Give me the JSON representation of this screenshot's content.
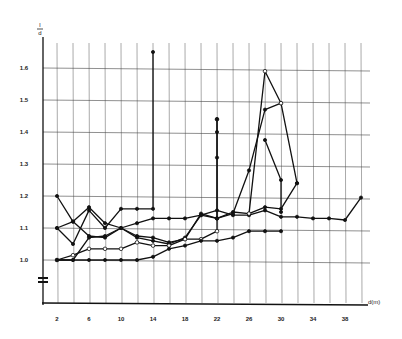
{
  "chart_data": {
    "type": "line",
    "title": "",
    "xlabel": "d(m)",
    "ylabel": "l/d",
    "xlim": [
      0,
      40
    ],
    "ylim": [
      0.9,
      1.7
    ],
    "grid": true,
    "legend": null,
    "x_ticks": [
      2,
      6,
      10,
      14,
      18,
      22,
      26,
      30,
      34,
      38
    ],
    "x_tick_labels": [
      "2",
      "6",
      "10",
      "14",
      "18",
      "22",
      "26",
      "30",
      "34",
      "38"
    ],
    "y_ticks": [
      1.0,
      1.1,
      1.2,
      1.3,
      1.4,
      1.5,
      1.6
    ],
    "y_tick_labels": [
      "1.0",
      "1.1",
      "1.2",
      "1.3",
      "1.4",
      "1.5",
      "1.6"
    ],
    "axis_break": "y-axis break below 1.0",
    "series": [
      {
        "name": "series-1",
        "marker": "filled",
        "points": [
          [
            2,
            1.2
          ],
          [
            4,
            1.12
          ],
          [
            6,
            1.165
          ],
          [
            8,
            1.115
          ],
          [
            10,
            1.1
          ],
          [
            12,
            1.075
          ],
          [
            14,
            1.07
          ],
          [
            16,
            1.055
          ],
          [
            18,
            1.065
          ],
          [
            20,
            1.145
          ],
          [
            22,
            1.13
          ],
          [
            24,
            1.15
          ],
          [
            26,
            1.145
          ],
          [
            28,
            1.165
          ],
          [
            30,
            1.16
          ],
          [
            32,
            1.24
          ]
        ]
      },
      {
        "name": "series-2",
        "marker": "filled",
        "points": [
          [
            2,
            1.1
          ],
          [
            4,
            1.05
          ],
          [
            6,
            1.155
          ],
          [
            8,
            1.1
          ],
          [
            10,
            1.16
          ],
          [
            12,
            1.16
          ],
          [
            14,
            1.16
          ],
          [
            14,
            1.65
          ]
        ]
      },
      {
        "name": "series-3",
        "marker": "filled",
        "points": [
          [
            2,
            1.1
          ],
          [
            4,
            1.12
          ],
          [
            6,
            1.075
          ],
          [
            8,
            1.07
          ],
          [
            10,
            1.1
          ],
          [
            12,
            1.115
          ],
          [
            14,
            1.13
          ],
          [
            16,
            1.13
          ],
          [
            18,
            1.13
          ],
          [
            20,
            1.14
          ],
          [
            22,
            1.155
          ],
          [
            24,
            1.14
          ],
          [
            26,
            1.14
          ],
          [
            28,
            1.155
          ],
          [
            30,
            1.135
          ],
          [
            32,
            1.135
          ],
          [
            34,
            1.13
          ],
          [
            36,
            1.13
          ],
          [
            38,
            1.125
          ],
          [
            40,
            1.195
          ]
        ]
      },
      {
        "name": "series-4",
        "marker": "filled",
        "points": [
          [
            2,
            1.0
          ],
          [
            4,
            1.0
          ],
          [
            6,
            1.07
          ],
          [
            8,
            1.075
          ],
          [
            10,
            1.1
          ],
          [
            12,
            1.07
          ],
          [
            14,
            1.06
          ],
          [
            16,
            1.05
          ],
          [
            18,
            1.07
          ],
          [
            20,
            1.14
          ],
          [
            22,
            1.13
          ],
          [
            24,
            1.145
          ],
          [
            26,
            1.28
          ],
          [
            28,
            1.47
          ],
          [
            30,
            1.49
          ],
          [
            32,
            1.24
          ]
        ]
      },
      {
        "name": "series-5",
        "marker": "open",
        "points": [
          [
            2,
            1.0
          ],
          [
            4,
            1.015
          ],
          [
            6,
            1.035
          ],
          [
            8,
            1.035
          ],
          [
            10,
            1.035
          ],
          [
            12,
            1.055
          ],
          [
            14,
            1.045
          ],
          [
            16,
            1.045
          ],
          [
            18,
            1.065
          ],
          [
            20,
            1.065
          ],
          [
            22,
            1.09
          ],
          [
            22,
            1.44
          ]
        ]
      },
      {
        "name": "series-6",
        "marker": "filled",
        "points": [
          [
            2,
            1.0
          ],
          [
            4,
            1.0
          ],
          [
            6,
            1.0
          ],
          [
            8,
            1.0
          ],
          [
            10,
            1.0
          ],
          [
            12,
            1.0
          ],
          [
            14,
            1.01
          ],
          [
            16,
            1.035
          ],
          [
            18,
            1.045
          ],
          [
            20,
            1.06
          ],
          [
            22,
            1.06
          ],
          [
            24,
            1.07
          ],
          [
            26,
            1.09
          ],
          [
            28,
            1.09
          ],
          [
            30,
            1.09
          ]
        ]
      },
      {
        "name": "series-7",
        "marker": "mixed",
        "points": [
          [
            22,
            1.44
          ],
          [
            22,
            1.4
          ],
          [
            22,
            1.32
          ],
          [
            22,
            1.13
          ]
        ]
      },
      {
        "name": "series-8",
        "marker": "open",
        "points": [
          [
            26,
            1.145
          ],
          [
            28,
            1.59
          ],
          [
            30,
            1.49
          ]
        ]
      },
      {
        "name": "series-9",
        "marker": "filled",
        "points": [
          [
            28,
            1.375
          ],
          [
            30,
            1.25
          ],
          [
            30,
            1.15
          ]
        ]
      }
    ]
  }
}
